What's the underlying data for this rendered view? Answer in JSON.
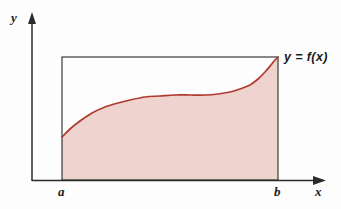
{
  "figure": {
    "axes": {
      "y_label": "y",
      "x_label": "x"
    },
    "bounds": {
      "lower_label": "a",
      "upper_label": "b"
    },
    "curve_label": "y = f(x)",
    "colors": {
      "region_fill": "#eed3cf",
      "curve_stroke": "#b0392f",
      "axis_stroke": "#2b2b2b",
      "rect_stroke": "#3a3a3a",
      "background": "#fdfdfd",
      "text": "#1a1a1a"
    }
  },
  "chart_data": {
    "type": "area",
    "xlabel": "x",
    "ylabel": "y",
    "grid": false,
    "legend": null,
    "annotations": [
      {
        "text": "y = f(x)",
        "x": 278,
        "y": 57,
        "placement": "right-of-curve-endpoint"
      },
      {
        "text": "a",
        "x": 62,
        "y": 180,
        "placement": "below-axis"
      },
      {
        "text": "b",
        "x": 278,
        "y": 180,
        "placement": "below-axis"
      }
    ],
    "axis_pixel_geometry": {
      "y_axis_x": 32,
      "y_axis_top": 14,
      "x_axis_y": 180,
      "x_axis_right": 325,
      "origin_x": 32
    },
    "bounding_rect": {
      "x0": 62,
      "y_top": 57,
      "x1": 278,
      "y_bottom": 180
    },
    "series": [
      {
        "name": "f(x)",
        "stroke": "#b0392f",
        "fill": "#eed3cf",
        "baseline": 180,
        "x": [
          62,
          70,
          80,
          92,
          105,
          118,
          130,
          145,
          160,
          175,
          190,
          205,
          218,
          230,
          240,
          250,
          258,
          265,
          271,
          275,
          278
        ],
        "y": [
          137,
          129,
          121,
          113,
          107,
          103,
          100,
          97,
          96,
          95,
          95,
          95,
          94,
          92,
          89,
          85,
          79,
          72,
          65,
          60,
          57
        ]
      }
    ],
    "xlim": [
      32,
      341
    ],
    "ylim": [
      209,
      0
    ]
  }
}
